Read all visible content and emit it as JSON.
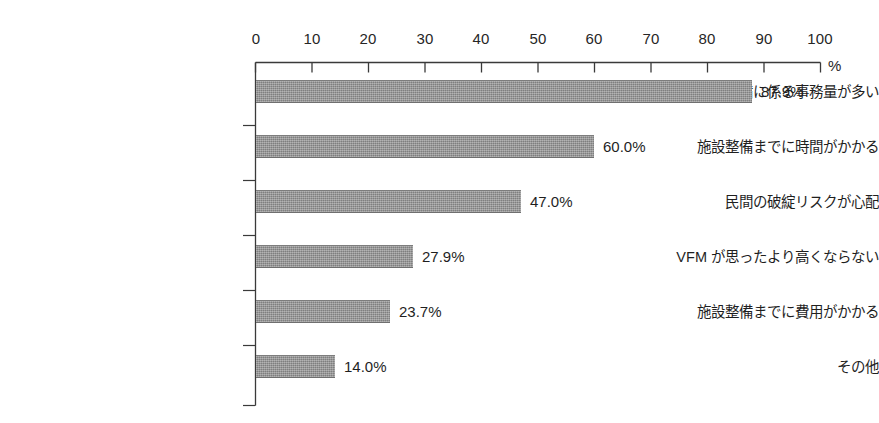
{
  "chart_data": {
    "type": "bar",
    "orientation": "horizontal",
    "title": "",
    "xlabel": "%",
    "ylabel": "",
    "xlim": [
      0,
      100
    ],
    "xticks": [
      "0",
      "10",
      "20",
      "30",
      "40",
      "50",
      "60",
      "70",
      "80",
      "90",
      "100"
    ],
    "grid": false,
    "legend": null,
    "unit": "%",
    "categories": [
      "準備に係る事務量が多い",
      "施設整備までに時間がかかる",
      "民間の破綻リスクが心配",
      "VFM が思ったより高くならない",
      "施設整備までに費用がかかる",
      "その他"
    ],
    "values": [
      87.9,
      60.0,
      47.0,
      27.9,
      23.7,
      14.0
    ],
    "value_labels": [
      "87.9%",
      "60.0%",
      "47.0%",
      "27.9%",
      "23.7%",
      "14.0%"
    ],
    "bar_color": "#8e8e8e",
    "axis_color": "#3a3a3a",
    "text_color": "#1f1f1f"
  }
}
